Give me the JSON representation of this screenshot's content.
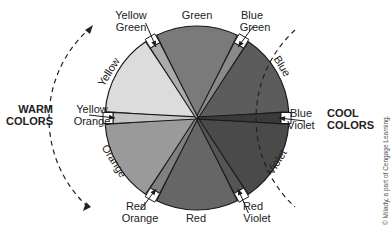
{
  "diagram": {
    "primary_secondary": [
      {
        "id": "green",
        "label": "Green",
        "color": "#7a7a7a"
      },
      {
        "id": "blue",
        "label": "Blue",
        "color": "#5c5c5c"
      },
      {
        "id": "violet",
        "label": "Violet",
        "color": "#4a4a4a"
      },
      {
        "id": "red",
        "label": "Red",
        "color": "#666666"
      },
      {
        "id": "orange",
        "label": "Orange",
        "color": "#9a9a9a"
      },
      {
        "id": "yellow",
        "label": "Yellow",
        "color": "#dcdcdc"
      }
    ],
    "tertiary": [
      {
        "id": "blue-green",
        "label_line1": "Blue",
        "label_line2": "Green",
        "color": "#8a8a8a"
      },
      {
        "id": "blue-violet",
        "label_line1": "Blue",
        "label_line2": "Violet",
        "color": "#3a3a3a"
      },
      {
        "id": "red-violet",
        "label_line1": "Red",
        "label_line2": "Violet",
        "color": "#555555"
      },
      {
        "id": "red-orange",
        "label_line1": "Red",
        "label_line2": "Orange",
        "color": "#808080"
      },
      {
        "id": "yellow-orange",
        "label_line1": "Yellow",
        "label_line2": "Orange",
        "color": "#c4c4c4"
      },
      {
        "id": "yellow-green",
        "label_line1": "Yellow",
        "label_line2": "Green",
        "color": "#ababab"
      }
    ],
    "groups": {
      "warm_line1": "WARM",
      "warm_line2": "COLORS",
      "cool_line1": "COOL",
      "cool_line2": "COLORS"
    },
    "copyright": "© Milady, a part of Cengage Learning."
  }
}
